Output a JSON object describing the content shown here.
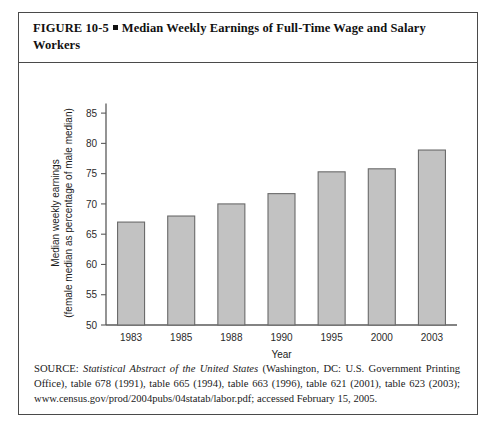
{
  "figure": {
    "label": "FIGURE 10-5",
    "title": "Median Weekly Earnings of Full-Time Wage and Salary Workers"
  },
  "source": {
    "prefix": "SOURCE: ",
    "italic_title": "Statistical Abstract of the United States",
    "rest": " (Washington, DC: U.S. Government Printing Office), table 678 (1991), table 665 (1994), table 663 (1996), table 621 (2001), table 623 (2003); www.census.gov/prod/2004pubs/04statab/labor.pdf; accessed February 15, 2005."
  },
  "colors": {
    "bar_fill": "#c2c2c2",
    "bar_stroke": "#6a6a6a",
    "axis": "#5a5a5a",
    "border": "#4a4a4a",
    "text": "#111111"
  },
  "chart_data": {
    "type": "bar",
    "title": "Median Weekly Earnings of Full-Time Wage and Salary Workers",
    "categories": [
      "1983",
      "1985",
      "1988",
      "1990",
      "1995",
      "2000",
      "2003"
    ],
    "values": [
      67.0,
      68.0,
      70.0,
      71.7,
      75.3,
      75.8,
      78.9
    ],
    "xlabel": "Year",
    "ylabel_line1": "Median weekly earnings",
    "ylabel_line2": "(female median as percentage of male median)",
    "ylim": [
      50,
      87
    ],
    "yticks": [
      50,
      55,
      60,
      65,
      70,
      75,
      80,
      85
    ],
    "ytick_labels": [
      "50",
      "55",
      "60",
      "65",
      "70",
      "75",
      "80",
      "85"
    ],
    "grid": false,
    "legend": null
  }
}
